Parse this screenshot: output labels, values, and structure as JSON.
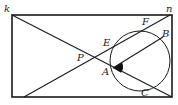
{
  "diagram": {
    "type": "geometry",
    "stroke_color": "#1a1a1a",
    "background": "#ffffff",
    "rectangle": {
      "x": 12,
      "y": 15,
      "width": 160,
      "height": 82
    },
    "circle": {
      "cx": 140,
      "cy": 61,
      "r": 30
    },
    "lines": [
      {
        "name": "diagonal-k",
        "x1": 12,
        "y1": 15,
        "x2": 172,
        "y2": 97
      },
      {
        "name": "line-to-n",
        "x1": 24,
        "y1": 97,
        "x2": 170,
        "y2": 15
      },
      {
        "name": "chord-AB",
        "x1": 113,
        "y1": 68,
        "x2": 163,
        "y2": 37
      }
    ],
    "labels": {
      "k": "k",
      "n": "n",
      "F": "F",
      "B": "B",
      "E": "E",
      "P": "P",
      "A": "A",
      "C": "C"
    }
  }
}
